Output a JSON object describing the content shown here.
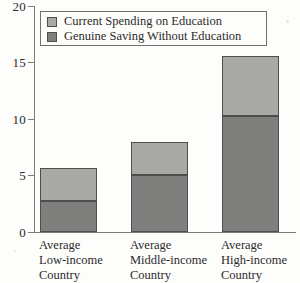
{
  "chart_data": {
    "type": "bar",
    "subtype": "stacked",
    "title": "",
    "xlabel": "",
    "ylabel": "",
    "ylim": [
      0,
      20
    ],
    "yticks": [
      0,
      5,
      10,
      15,
      20
    ],
    "ytick_labels": [
      "0",
      "5",
      "10",
      "15",
      "20"
    ],
    "grid": false,
    "legend_position": "top-left-inside",
    "categories": [
      "Average Low-income Country",
      "Average Middle-income Country",
      "Average High-income Country"
    ],
    "category_lines": [
      [
        "Average",
        "Low-income",
        "Country"
      ],
      [
        "Average",
        "Middle-income",
        "Country"
      ],
      [
        "Average",
        "High-income",
        "Country"
      ]
    ],
    "series": [
      {
        "name": "Genuine Saving Without Education",
        "color": "#7f7f7d",
        "values": [
          2.7,
          5.0,
          10.3
        ]
      },
      {
        "name": "Current Spending on Education",
        "color": "#a9a9a6",
        "values": [
          3.0,
          3.0,
          5.3
        ]
      }
    ],
    "stack_totals": [
      5.7,
      8.0,
      15.6
    ]
  },
  "legend": {
    "entries": [
      {
        "label": "Current Spending on Education",
        "swatch": "light-grey-swatch"
      },
      {
        "label": "Genuine Saving Without Education",
        "swatch": "dark-grey-swatch"
      }
    ]
  },
  "axes": {
    "y_tick_labels": [
      "20",
      "15",
      "10",
      "5",
      "0"
    ]
  },
  "colors": {
    "light_grey": "#a9a9a6",
    "dark_grey": "#7f7f7d",
    "axis": "#7b7b77",
    "background": "#fdfdfb",
    "text": "#2b2b2b"
  }
}
